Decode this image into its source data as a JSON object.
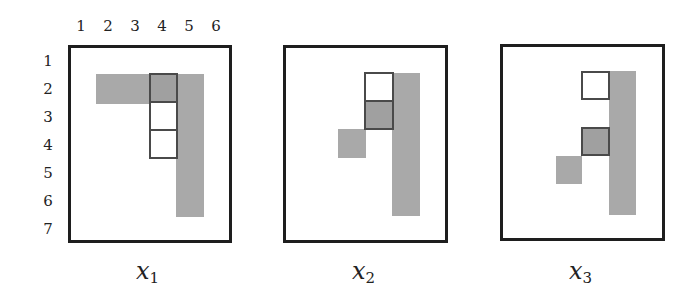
{
  "figure": {
    "column_ticks": [
      "1",
      "2",
      "3",
      "4",
      "5",
      "6"
    ],
    "row_ticks": [
      "1",
      "2",
      "3",
      "4",
      "5",
      "6",
      "7"
    ],
    "colors": {
      "shaded": "#a9a9a9",
      "border": "#1e1e1e",
      "outline": "#4a4a4a"
    },
    "panels": [
      {
        "label_var": "x",
        "label_sub": "1",
        "shaded_cells": [
          [
            2,
            2
          ],
          [
            2,
            3
          ],
          [
            2,
            5
          ],
          [
            3,
            5
          ],
          [
            4,
            5
          ],
          [
            5,
            5
          ],
          [
            6,
            5
          ]
        ],
        "outlined_cells": [
          {
            "row": 2,
            "col": 4,
            "fill": "gray"
          },
          {
            "row": 3,
            "col": 4,
            "fill": "white"
          },
          {
            "row": 4,
            "col": 4,
            "fill": "white"
          }
        ]
      },
      {
        "label_var": "x",
        "label_sub": "2",
        "shaded_cells": [
          [
            4,
            3
          ],
          [
            2,
            5
          ],
          [
            3,
            5
          ],
          [
            4,
            5
          ],
          [
            5,
            5
          ],
          [
            6,
            5
          ]
        ],
        "outlined_cells": [
          {
            "row": 2,
            "col": 4,
            "fill": "white"
          },
          {
            "row": 3,
            "col": 4,
            "fill": "gray"
          }
        ]
      },
      {
        "label_var": "x",
        "label_sub": "3",
        "shaded_cells": [
          [
            5,
            3
          ],
          [
            2,
            5
          ],
          [
            3,
            5
          ],
          [
            4,
            5
          ],
          [
            5,
            5
          ],
          [
            6,
            5
          ]
        ],
        "outlined_cells": [
          {
            "row": 2,
            "col": 4,
            "fill": "white"
          },
          {
            "row": 4,
            "col": 4,
            "fill": "gray"
          }
        ]
      }
    ]
  }
}
